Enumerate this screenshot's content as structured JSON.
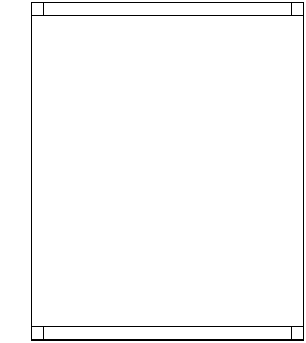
{
  "diagram": {
    "title": "",
    "corner_labels": {
      "top_left": "F",
      "top_right": "F",
      "bottom_left": "F",
      "bottom_right": "F"
    },
    "banner_labels": {
      "top_center": "I",
      "bottom_center": "I"
    },
    "side_markers": {
      "left": "I",
      "right": "I"
    },
    "marked_row_index": 13,
    "row_label_prefix": "ROW",
    "columns": 21,
    "row_labels": [
      "1",
      "2",
      "3",
      "4",
      "5",
      "6",
      "7",
      "8",
      "9",
      "10",
      "11",
      "12",
      "13",
      "14",
      "14",
      "13",
      "12",
      "11",
      "10",
      "9",
      "8",
      "7",
      "6",
      "5",
      "4",
      "3",
      "2",
      "1"
    ],
    "rows": [
      [
        "",
        "",
        "",
        "",
        "",
        "",
        "",
        "",
        "",
        "",
        "",
        "",
        "",
        "",
        "",
        "",
        "",
        "",
        "",
        "",
        ""
      ],
      [
        "",
        "",
        "",
        "",
        "",
        "",
        "",
        "",
        "",
        "",
        "",
        "",
        "",
        "",
        "",
        "",
        "",
        "",
        "",
        "",
        ""
      ],
      [
        "",
        "",
        "",
        "",
        "",
        "",
        "",
        "",
        "",
        "",
        "",
        "",
        "",
        "",
        "",
        "",
        "",
        "",
        "",
        "",
        ""
      ],
      [
        "",
        "",
        "",
        "",
        "",
        "",
        "",
        "",
        "",
        "",
        "",
        "",
        "",
        "",
        "",
        "",
        "",
        "",
        "",
        "",
        ""
      ],
      [
        "",
        "",
        "",
        "",
        "",
        "",
        "",
        "",
        "",
        "",
        "",
        "",
        "",
        "",
        "",
        "",
        "",
        "",
        "",
        "",
        ""
      ],
      [
        "",
        "",
        "",
        "",
        "",
        "",
        "",
        "",
        "",
        "",
        "",
        "",
        "",
        "",
        "",
        "",
        "",
        "",
        "",
        "",
        ""
      ],
      [
        "",
        "",
        "",
        "",
        "",
        "",
        "",
        "",
        "",
        "",
        "",
        "",
        "",
        "",
        "",
        "",
        "",
        "",
        "",
        "",
        ""
      ],
      [
        "",
        "",
        "",
        "",
        "",
        "",
        "",
        "",
        "",
        "",
        "",
        "",
        "",
        "",
        "",
        "",
        "",
        "",
        "",
        "",
        ""
      ],
      [
        "",
        "",
        "",
        "",
        "",
        "",
        "",
        "",
        "",
        "",
        "",
        "",
        "",
        "",
        "",
        "",
        "",
        "",
        "",
        "",
        ""
      ],
      [
        "",
        "",
        "",
        "",
        "",
        "",
        "",
        "",
        "",
        "",
        "",
        "",
        "",
        "",
        "",
        "",
        "",
        "",
        "",
        "",
        ""
      ],
      [
        "",
        "",
        "",
        "",
        "",
        "",
        "",
        "",
        "",
        "",
        "",
        "",
        "",
        "",
        "",
        "",
        "",
        "",
        "",
        "",
        ""
      ],
      [
        "",
        "",
        "",
        "",
        "",
        "",
        "",
        "",
        "",
        "",
        "D",
        "",
        "",
        "",
        "",
        "",
        "",
        "",
        "",
        "",
        ""
      ],
      [
        "",
        "",
        "",
        "",
        "",
        "",
        "",
        "",
        "",
        "D",
        "C",
        "D",
        "",
        "",
        "",
        "",
        "",
        "",
        "",
        "",
        ""
      ],
      [
        "",
        "",
        "",
        "",
        "",
        "",
        "",
        "",
        "D",
        "C",
        "B",
        "C",
        "D",
        "",
        "",
        "",
        "",
        "",
        "",
        "",
        ""
      ],
      [
        "D",
        "J",
        "I",
        "H",
        "G",
        "F",
        "E",
        "D",
        "C",
        "B",
        "A",
        "B",
        "C",
        "D",
        "",
        "",
        "",
        "",
        "",
        "",
        ""
      ],
      [
        "A",
        "D",
        "J",
        "I",
        "H",
        "G",
        "F",
        "E",
        "D",
        "C",
        "B",
        "C",
        "D",
        "",
        "",
        "",
        "",
        "",
        "",
        "",
        ""
      ],
      [
        "E",
        "A",
        "D",
        "J",
        "I",
        "H",
        "G",
        "F",
        "E",
        "D",
        "C",
        "D",
        "",
        "",
        "",
        "",
        "",
        "",
        "",
        "",
        ""
      ],
      [
        "F",
        "E",
        "A",
        "D",
        "J",
        "I",
        "H",
        "G",
        "F",
        "E",
        "D",
        "",
        "",
        "",
        "",
        "",
        "",
        "",
        "",
        "",
        ""
      ],
      [
        "X",
        "F",
        "E",
        "A",
        "D",
        "J",
        "I",
        "H",
        "G",
        "F",
        "E",
        "",
        "",
        "",
        "",
        "",
        "",
        "",
        "",
        "",
        ""
      ],
      [
        "J",
        "X",
        "F",
        "E",
        "A",
        "D",
        "J",
        "I",
        "H",
        "G",
        "F",
        "",
        "",
        "",
        "",
        "",
        "",
        "",
        "",
        "",
        ""
      ],
      [
        "C",
        "J",
        "X",
        "F",
        "E",
        "A",
        "D",
        "J",
        "I",
        "H",
        "G",
        "",
        "",
        "",
        "",
        "",
        "",
        "",
        "",
        "",
        ""
      ],
      [
        "Y",
        "C",
        "J",
        "X",
        "F",
        "E",
        "A",
        "D",
        "J",
        "I",
        "H",
        "",
        "",
        "",
        "",
        "",
        "",
        "",
        "",
        "",
        ""
      ],
      [
        "E",
        "Y",
        "C",
        "J",
        "X",
        "F",
        "E",
        "A",
        "D",
        "J",
        "I",
        "",
        "",
        "",
        "",
        "",
        "",
        "",
        "",
        "",
        ""
      ],
      [
        "F",
        "E",
        "Y",
        "C",
        "J",
        "X",
        "F",
        "E",
        "A",
        "D",
        "J",
        "",
        "",
        "",
        "",
        "",
        "",
        "",
        "",
        "",
        ""
      ],
      [
        "A",
        "F",
        "E",
        "Y",
        "C",
        "J",
        "X",
        "F",
        "E",
        "A",
        "D",
        "",
        "",
        "",
        "",
        "",
        "",
        "",
        "",
        "",
        ""
      ],
      [
        "B",
        "A",
        "F",
        "E",
        "Y",
        "C",
        "J",
        "X",
        "F",
        "E",
        "A",
        "",
        "",
        "",
        "",
        "",
        "",
        "",
        "",
        "",
        ""
      ],
      [
        "Z",
        "B",
        "A",
        "F",
        "E",
        "Y",
        "C",
        "J",
        "X",
        "F",
        "E",
        "F",
        "X",
        "J",
        "C",
        "Y",
        "E",
        "F",
        "A",
        "B",
        "Z"
      ],
      [
        "C",
        "Z",
        "B",
        "A",
        "F",
        "E",
        "Y",
        "C",
        "J",
        "X",
        "F",
        "X",
        "J",
        "C",
        "Y",
        "E",
        "F",
        "A",
        "B",
        "Z",
        "C"
      ]
    ]
  }
}
